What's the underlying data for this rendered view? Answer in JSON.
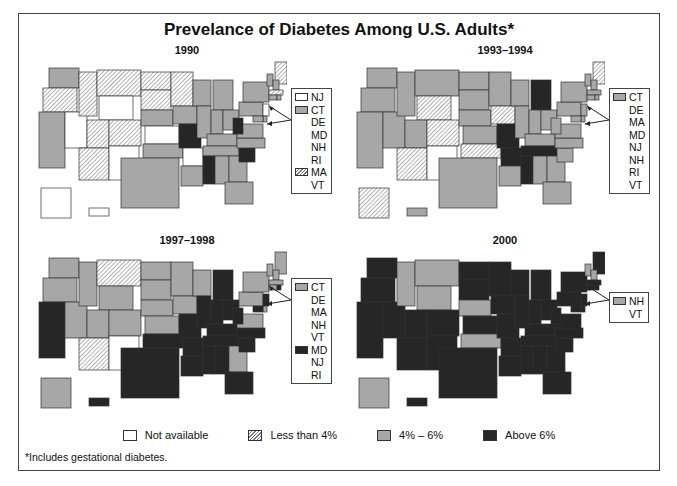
{
  "title": "Prevelance of Diabetes Among U.S. Adults*",
  "footnote": "*Includes gestational diabetes.",
  "colors": {
    "not_available": "#ffffff",
    "less_than_4": "hatched",
    "4_to_6": "#a7a7a7",
    "above_6": "#262626",
    "border": "#444444"
  },
  "legend": [
    {
      "key": "na",
      "label": "Not available"
    },
    {
      "key": "lt4",
      "label": "Less than 4%"
    },
    {
      "key": "4to6",
      "label": "4% – 6%"
    },
    {
      "key": "gt6",
      "label": "Above 6%"
    }
  ],
  "panels": [
    {
      "title": "1990",
      "inset_legend": [
        {
          "key": "na",
          "label": "NJ"
        },
        {
          "key": "4to6",
          "label": "CT"
        },
        {
          "key": "",
          "label": "DE"
        },
        {
          "key": "",
          "label": "MD"
        },
        {
          "key": "",
          "label": "NH"
        },
        {
          "key": "",
          "label": "RI"
        },
        {
          "key": "lt4",
          "label": "MA"
        },
        {
          "key": "",
          "label": "VT"
        }
      ],
      "states": {
        "WA": "4to6",
        "OR": "lt4",
        "CA": "4to6",
        "NV": "na",
        "ID": "lt4",
        "MT": "lt4",
        "WY": "na",
        "UT": "lt4",
        "CO": "lt4",
        "AZ": "lt4",
        "NM": "na",
        "ND": "lt4",
        "SD": "lt4",
        "NE": "4to6",
        "KS": "na",
        "OK": "4to6",
        "TX": "4to6",
        "MN": "lt4",
        "IA": "4to6",
        "MO": "gt6",
        "AR": "na",
        "LA": "4to6",
        "WI": "4to6",
        "IL": "4to6",
        "MI": "4to6",
        "IN": "4to6",
        "OH": "4to6",
        "KY": "4to6",
        "TN": "4to6",
        "MS": "gt6",
        "AL": "4to6",
        "GA": "4to6",
        "FL": "4to6",
        "SC": "gt6",
        "NC": "4to6",
        "VA": "4to6",
        "WV": "gt6",
        "PA": "4to6",
        "NY": "4to6",
        "ME": "lt4",
        "VT": "4to6",
        "NH": "4to6",
        "MA": "lt4",
        "CT": "4to6",
        "RI": "4to6",
        "NJ": "na",
        "DE": "4to6",
        "MD": "4to6",
        "AK": "na",
        "HI": "na"
      }
    },
    {
      "title": "1993–1994",
      "inset_legend": [
        {
          "key": "4to6",
          "label": "CT"
        },
        {
          "key": "",
          "label": "DE"
        },
        {
          "key": "",
          "label": "MA"
        },
        {
          "key": "",
          "label": "MD"
        },
        {
          "key": "",
          "label": "NJ"
        },
        {
          "key": "",
          "label": "NH"
        },
        {
          "key": "",
          "label": "RI"
        },
        {
          "key": "",
          "label": "VT"
        }
      ],
      "states": {
        "WA": "4to6",
        "OR": "4to6",
        "CA": "4to6",
        "NV": "4to6",
        "ID": "4to6",
        "MT": "4to6",
        "WY": "lt4",
        "UT": "4to6",
        "CO": "lt4",
        "AZ": "lt4",
        "NM": "na",
        "ND": "4to6",
        "SD": "4to6",
        "NE": "4to6",
        "KS": "4to6",
        "OK": "lt4",
        "TX": "4to6",
        "MN": "4to6",
        "IA": "lt4",
        "MO": "gt6",
        "AR": "gt6",
        "LA": "4to6",
        "WI": "4to6",
        "IL": "4to6",
        "MI": "gt6",
        "IN": "4to6",
        "OH": "4to6",
        "KY": "4to6",
        "TN": "gt6",
        "MS": "gt6",
        "AL": "4to6",
        "GA": "4to6",
        "FL": "4to6",
        "SC": "4to6",
        "NC": "4to6",
        "VA": "4to6",
        "WV": "4to6",
        "PA": "4to6",
        "NY": "4to6",
        "ME": "lt4",
        "VT": "4to6",
        "NH": "4to6",
        "MA": "4to6",
        "CT": "4to6",
        "RI": "4to6",
        "NJ": "4to6",
        "DE": "4to6",
        "MD": "4to6",
        "AK": "lt4",
        "HI": "4to6"
      }
    },
    {
      "title": "1997–1998",
      "inset_legend": [
        {
          "key": "4to6",
          "label": "CT"
        },
        {
          "key": "",
          "label": "DE"
        },
        {
          "key": "",
          "label": "MA"
        },
        {
          "key": "",
          "label": "NH"
        },
        {
          "key": "",
          "label": "VT"
        },
        {
          "key": "gt6",
          "label": "MD"
        },
        {
          "key": "",
          "label": "NJ"
        },
        {
          "key": "",
          "label": "RI"
        }
      ],
      "states": {
        "WA": "4to6",
        "OR": "4to6",
        "CA": "gt6",
        "NV": "4to6",
        "ID": "4to6",
        "MT": "lt4",
        "WY": "4to6",
        "UT": "4to6",
        "CO": "4to6",
        "AZ": "lt4",
        "NM": "na",
        "ND": "4to6",
        "SD": "4to6",
        "NE": "4to6",
        "KS": "4to6",
        "OK": "gt6",
        "TX": "gt6",
        "MN": "4to6",
        "IA": "4to6",
        "MO": "gt6",
        "AR": "gt6",
        "LA": "gt6",
        "WI": "4to6",
        "IL": "gt6",
        "MI": "gt6",
        "IN": "gt6",
        "OH": "gt6",
        "KY": "gt6",
        "TN": "gt6",
        "MS": "gt6",
        "AL": "gt6",
        "GA": "4to6",
        "FL": "gt6",
        "SC": "gt6",
        "NC": "gt6",
        "VA": "4to6",
        "WV": "gt6",
        "PA": "4to6",
        "NY": "4to6",
        "ME": "4to6",
        "VT": "4to6",
        "NH": "4to6",
        "MA": "4to6",
        "CT": "4to6",
        "RI": "gt6",
        "NJ": "gt6",
        "DE": "4to6",
        "MD": "gt6",
        "AK": "4to6",
        "HI": "gt6"
      }
    },
    {
      "title": "2000",
      "inset_legend": [
        {
          "key": "4to6",
          "label": "NH"
        },
        {
          "key": "",
          "label": "VT"
        }
      ],
      "states": {
        "WA": "gt6",
        "OR": "gt6",
        "CA": "gt6",
        "NV": "gt6",
        "ID": "4to6",
        "MT": "4to6",
        "WY": "4to6",
        "UT": "gt6",
        "CO": "gt6",
        "AZ": "gt6",
        "NM": "gt6",
        "ND": "gt6",
        "SD": "gt6",
        "NE": "4to6",
        "KS": "gt6",
        "OK": "4to6",
        "TX": "gt6",
        "MN": "gt6",
        "IA": "gt6",
        "MO": "gt6",
        "AR": "gt6",
        "LA": "gt6",
        "WI": "gt6",
        "IL": "gt6",
        "MI": "gt6",
        "IN": "gt6",
        "OH": "gt6",
        "KY": "gt6",
        "TN": "gt6",
        "MS": "gt6",
        "AL": "gt6",
        "GA": "gt6",
        "FL": "gt6",
        "SC": "gt6",
        "NC": "gt6",
        "VA": "gt6",
        "WV": "gt6",
        "PA": "gt6",
        "NY": "gt6",
        "ME": "gt6",
        "VT": "4to6",
        "NH": "4to6",
        "MA": "gt6",
        "CT": "gt6",
        "RI": "gt6",
        "NJ": "gt6",
        "DE": "gt6",
        "MD": "gt6",
        "AK": "4to6",
        "HI": "gt6"
      }
    }
  ]
}
